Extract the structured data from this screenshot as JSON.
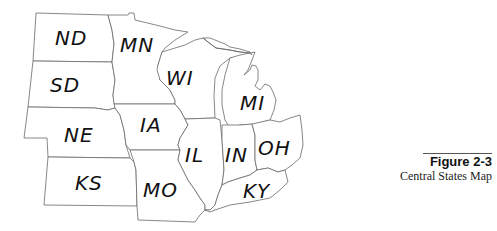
{
  "map": {
    "title": "Central States Map",
    "states": [
      {
        "abbr": "ND",
        "name": "North Dakota"
      },
      {
        "abbr": "SD",
        "name": "South Dakota"
      },
      {
        "abbr": "NE",
        "name": "Nebraska"
      },
      {
        "abbr": "KS",
        "name": "Kansas"
      },
      {
        "abbr": "MN",
        "name": "Minnesota"
      },
      {
        "abbr": "IA",
        "name": "Iowa"
      },
      {
        "abbr": "MO",
        "name": "Missouri"
      },
      {
        "abbr": "WI",
        "name": "Wisconsin"
      },
      {
        "abbr": "IL",
        "name": "Illinois"
      },
      {
        "abbr": "MI",
        "name": "Michigan"
      },
      {
        "abbr": "IN",
        "name": "Indiana"
      },
      {
        "abbr": "OH",
        "name": "Ohio"
      },
      {
        "abbr": "KY",
        "name": "Kentucky"
      }
    ]
  },
  "caption": {
    "figure": "Figure 2-3",
    "subtitle": "Central States Map"
  }
}
